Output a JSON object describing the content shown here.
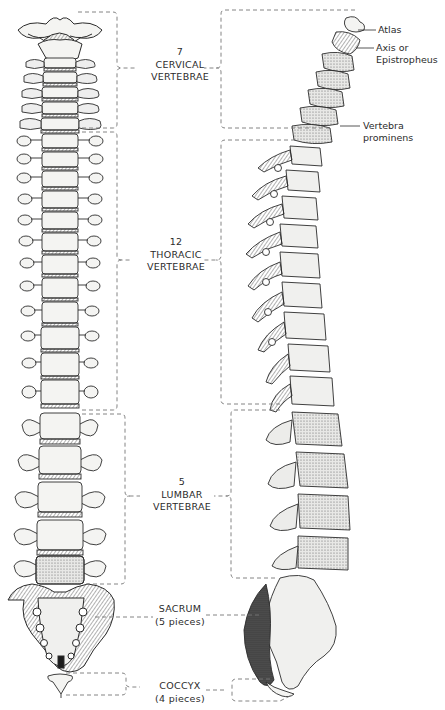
{
  "figure": {
    "views": [
      "anterior-view",
      "lateral-view"
    ]
  },
  "regions": [
    {
      "id": "cervical",
      "count": "7",
      "name": "CERVICAL",
      "sub": "VERTEBRAE"
    },
    {
      "id": "thoracic",
      "count": "12",
      "name": "THORACIC",
      "sub": "VERTEBRAE"
    },
    {
      "id": "lumbar",
      "count": "5",
      "name": "LUMBAR",
      "sub": "VERTEBRAE"
    },
    {
      "id": "sacrum",
      "count": "",
      "name": "SACRUM",
      "sub": "(5 pieces)"
    },
    {
      "id": "coccyx",
      "count": "",
      "name": "COCCYX",
      "sub": "(4 pieces)"
    }
  ],
  "callouts": {
    "atlas": "Atlas",
    "axis_line1": "Axis or",
    "axis_line2": "Epistropheus",
    "prominens_line1": "Vertebra",
    "prominens_line2": "prominens"
  },
  "colors": {
    "ink": "#2b2b2b",
    "bone": "#f4f4f2",
    "shade": "#9a9a9a",
    "bracket": "#777777"
  }
}
